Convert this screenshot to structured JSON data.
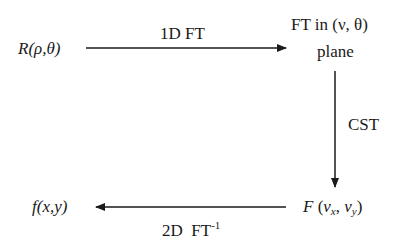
{
  "diagram": {
    "type": "flow",
    "nodes": {
      "sinogram": {
        "label": "R(ρ,θ)"
      },
      "ft_plane": {
        "line1": "FT in (ν, θ)",
        "line2": "plane"
      },
      "cartesian_ft": {
        "prefix": "F",
        "open": " (",
        "var1": "v",
        "sub1": "x",
        "sep": ", ",
        "var2": "v",
        "sub2": "y",
        "close": ")"
      },
      "image": {
        "label": "f(x,y)"
      }
    },
    "edges": {
      "top": {
        "from": "sinogram",
        "to": "ft_plane",
        "label": "1D FT"
      },
      "right": {
        "from": "ft_plane",
        "to": "cartesian_ft",
        "label": "CST"
      },
      "bottom": {
        "from": "cartesian_ft",
        "to": "image",
        "label_main": "2D  FT",
        "label_sup": "-1"
      }
    },
    "colors": {
      "ink": "#1a1a1a",
      "background": "#ffffff"
    }
  }
}
